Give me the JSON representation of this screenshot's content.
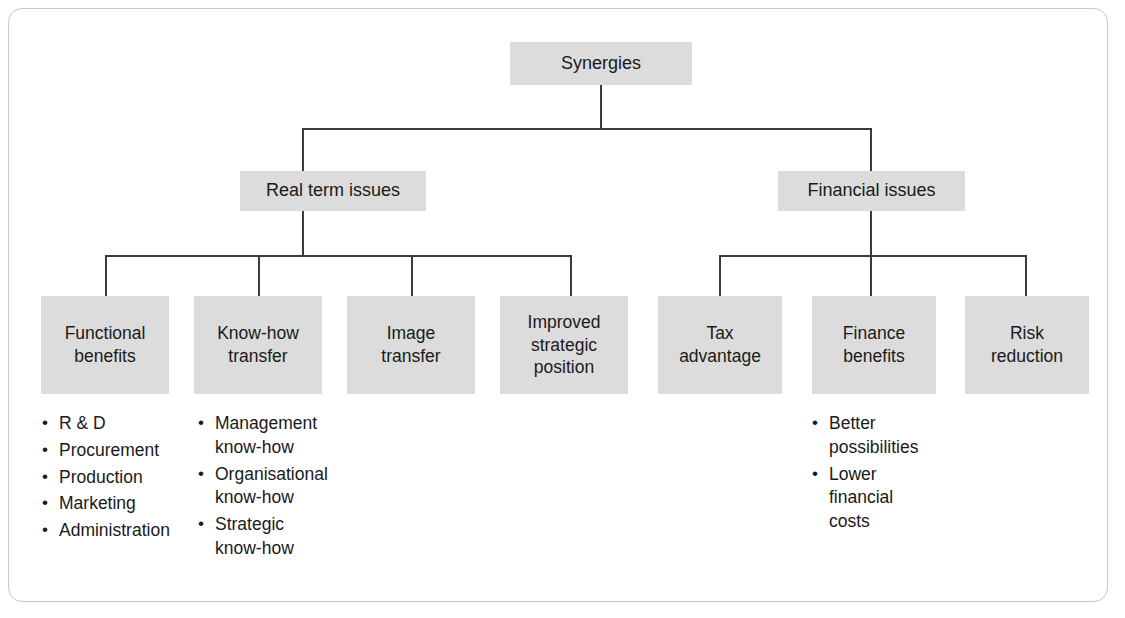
{
  "diagram": {
    "title_node": {
      "label": "Synergies"
    },
    "level2": [
      {
        "label": "Real term issues"
      },
      {
        "label": "Financial issues"
      }
    ],
    "level3_left": [
      {
        "label": "Functional\nbenefits"
      },
      {
        "label": "Know-how\ntransfer"
      },
      {
        "label": "Image\ntransfer"
      },
      {
        "label": "Improved\nstrategic\nposition"
      }
    ],
    "level3_right": [
      {
        "label": "Tax\nadvantage"
      },
      {
        "label": "Finance\nbenefits"
      },
      {
        "label": "Risk\nreduction"
      }
    ],
    "bullets_functional": [
      "R & D",
      "Procurement",
      "Production",
      "Marketing",
      "Administration"
    ],
    "bullets_knowhow": [
      "Management\nknow-how",
      "Organisational\nknow-how",
      "Strategic\nknow-how"
    ],
    "bullets_finance": [
      "Better\npossibilities",
      "Lower\nfinancial\ncosts"
    ],
    "colors": {
      "node_fill": "#dcdcdc",
      "line": "#3b3b3b",
      "text": "#1a1a1a",
      "frame_border": "#c9c9c9",
      "background": "#ffffff"
    }
  }
}
